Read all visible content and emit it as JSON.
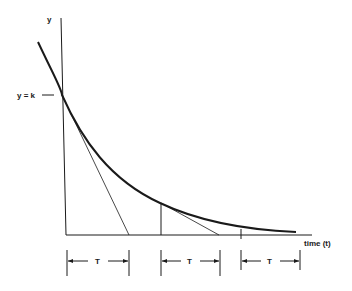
{
  "diagram": {
    "y_axis_label": "y",
    "x_axis_label": "time (t)",
    "intercept_label": "y = k",
    "interval_labels": [
      "T",
      "T",
      "T"
    ],
    "colors": {
      "ink": "#1a1a1a",
      "background": "#ffffff"
    }
  }
}
